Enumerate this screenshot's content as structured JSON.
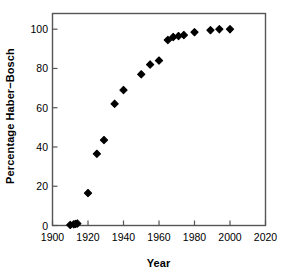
{
  "chart_data": {
    "type": "scatter",
    "title": "",
    "xlabel": "Year",
    "ylabel": "Percentage Haber−Bosch",
    "xlim": [
      1900,
      2020
    ],
    "ylim": [
      0,
      108
    ],
    "xticks": [
      1900,
      1920,
      1940,
      1960,
      1980,
      2000,
      2020
    ],
    "xtick_labels": [
      "1900",
      "1920",
      "1940",
      "1960",
      "1980",
      "2000",
      "2020"
    ],
    "yticks": [
      0,
      20,
      40,
      60,
      80,
      100
    ],
    "ytick_labels": [
      "0",
      "20",
      "40",
      "60",
      "80",
      "100"
    ],
    "grid": false,
    "legend": null,
    "marker": "diamond",
    "marker_color": "#000000",
    "marker_size": 6,
    "x": [
      1910,
      1912,
      1913,
      1914,
      1920,
      1925,
      1929,
      1935,
      1940,
      1950,
      1955,
      1960,
      1965,
      1968,
      1971,
      1974,
      1980,
      1989,
      1994,
      2000
    ],
    "values": [
      0.3,
      0.6,
      0.8,
      1.0,
      16.5,
      36.5,
      43.5,
      62.0,
      69.0,
      77.0,
      82.0,
      84.0,
      94.5,
      96.0,
      96.5,
      97.0,
      98.5,
      99.5,
      100.0,
      100.0
    ],
    "series": [
      {
        "name": "Percentage Haber−Bosch",
        "x": [
          1910,
          1912,
          1913,
          1914,
          1920,
          1925,
          1929,
          1935,
          1940,
          1950,
          1955,
          1960,
          1965,
          1968,
          1971,
          1974,
          1980,
          1989,
          1994,
          2000
        ],
        "values": [
          0.3,
          0.6,
          0.8,
          1.0,
          16.5,
          36.5,
          43.5,
          62.0,
          69.0,
          77.0,
          82.0,
          84.0,
          94.5,
          96.0,
          96.5,
          97.0,
          98.5,
          99.5,
          100.0,
          100.0
        ]
      }
    ]
  },
  "axes": {
    "frame_color": "#555555",
    "background": "#ffffff"
  }
}
